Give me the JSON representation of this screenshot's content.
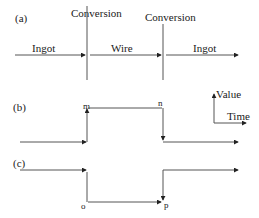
{
  "panels": {
    "a": {
      "label": "(a)",
      "conversion_labels": [
        "Conversion",
        "Conversion"
      ],
      "segments": [
        "Ingot",
        "Wire",
        "Ingot"
      ]
    },
    "b": {
      "label": "(b)",
      "points": {
        "m": "m",
        "n": "n"
      }
    },
    "c": {
      "label": "(c)",
      "points": {
        "o": "o",
        "p": "p"
      }
    }
  },
  "legend": {
    "y_axis": "Value",
    "x_axis": "Time"
  },
  "colors": {
    "line": "#555555",
    "text": "#1a1a1a"
  }
}
